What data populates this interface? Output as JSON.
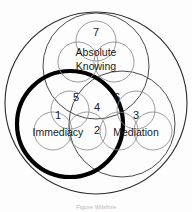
{
  "figure": {
    "caption": "Figure Wilshire",
    "background_color": "#fdfdfd",
    "line_color": "#2b2b2b",
    "thin_line_color": "#6e6e6e",
    "highlight_color": "#000000",
    "text_color": "#1a1a1a"
  },
  "regions": [
    {
      "id": "immediacy",
      "number": "1",
      "label": "Immediacy"
    },
    {
      "id": "overlap-immediacy-mediation",
      "number": "2",
      "label": ""
    },
    {
      "id": "mediation",
      "number": "3",
      "label": "Mediation"
    },
    {
      "id": "center-all",
      "number": "4",
      "label": ""
    },
    {
      "id": "overlap-immediacy-absolute",
      "number": "5",
      "label": ""
    },
    {
      "id": "overlap-mediation-absolute",
      "number": "6",
      "label": ""
    },
    {
      "id": "absolute-knowing",
      "number": "7",
      "label_line1": "Absolute",
      "label_line2": "Knowing"
    }
  ],
  "labels": {
    "n1": "1",
    "n2": "2",
    "n3": "3",
    "n4": "4",
    "n5": "5",
    "n6": "6",
    "n7": "7",
    "immediacy": "Immediacy",
    "mediation": "Mediation",
    "absolute_line1": "Absolute",
    "absolute_line2": "Knowing"
  }
}
